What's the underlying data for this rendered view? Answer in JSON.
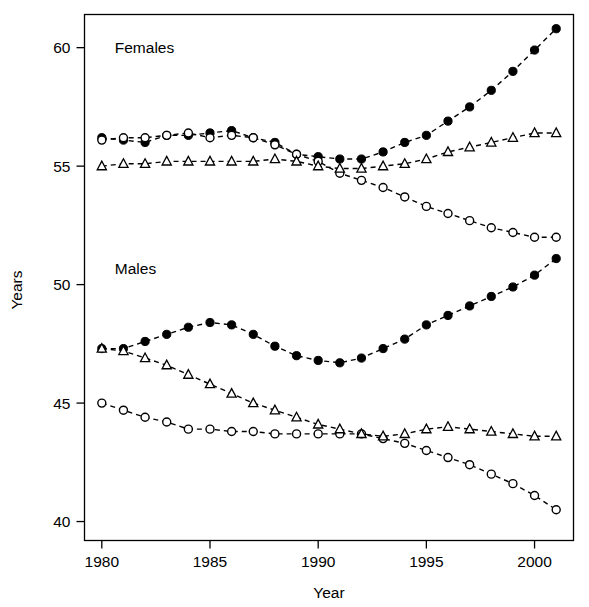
{
  "chart_data": {
    "type": "line",
    "title": "",
    "xlabel": "Year",
    "ylabel": "Years",
    "xlim": [
      1979.2,
      2001.8
    ],
    "ylim": [
      39.2,
      61.4
    ],
    "xticks": [
      1980,
      1985,
      1990,
      1995,
      2000
    ],
    "yticks": [
      40,
      45,
      50,
      55,
      60
    ],
    "grid": false,
    "legend": "none",
    "annotations": [
      {
        "text": "Females",
        "x": 1980.6,
        "y": 60.0
      },
      {
        "text": "Males",
        "x": 1980.6,
        "y": 50.7
      }
    ],
    "x": [
      1980,
      1981,
      1982,
      1983,
      1984,
      1985,
      1986,
      1987,
      1988,
      1989,
      1990,
      1991,
      1992,
      1993,
      1994,
      1995,
      1996,
      1997,
      1998,
      1999,
      2000,
      2001
    ],
    "series": [
      {
        "name": "Females - filled circle",
        "group": "Females",
        "marker": "filled-circle",
        "values": [
          56.2,
          56.1,
          56.0,
          56.3,
          56.3,
          56.4,
          56.5,
          56.2,
          56.0,
          55.5,
          55.4,
          55.3,
          55.3,
          55.6,
          56.0,
          56.3,
          56.9,
          57.5,
          58.2,
          59.0,
          59.9,
          60.8
        ]
      },
      {
        "name": "Females - open circle",
        "group": "Females",
        "marker": "open-circle",
        "values": [
          56.1,
          56.2,
          56.2,
          56.3,
          56.4,
          56.2,
          56.3,
          56.2,
          55.9,
          55.5,
          55.2,
          54.7,
          54.4,
          54.1,
          53.7,
          53.3,
          53.0,
          52.7,
          52.4,
          52.2,
          52.0,
          52.0
        ]
      },
      {
        "name": "Females - triangle",
        "group": "Females",
        "marker": "triangle",
        "values": [
          55.0,
          55.1,
          55.1,
          55.2,
          55.2,
          55.2,
          55.2,
          55.2,
          55.3,
          55.2,
          55.0,
          54.9,
          54.9,
          55.0,
          55.1,
          55.3,
          55.6,
          55.8,
          56.0,
          56.2,
          56.4,
          56.4
        ]
      },
      {
        "name": "Males - filled circle",
        "group": "Males",
        "marker": "filled-circle",
        "values": [
          47.3,
          47.3,
          47.6,
          47.9,
          48.2,
          48.4,
          48.3,
          47.9,
          47.4,
          47.0,
          46.8,
          46.7,
          46.9,
          47.3,
          47.7,
          48.3,
          48.7,
          49.1,
          49.5,
          49.9,
          50.4,
          51.1
        ]
      },
      {
        "name": "Males - open circle",
        "group": "Males",
        "marker": "open-circle",
        "values": [
          45.0,
          44.7,
          44.4,
          44.2,
          43.9,
          43.9,
          43.8,
          43.8,
          43.7,
          43.7,
          43.7,
          43.7,
          43.7,
          43.5,
          43.3,
          43.0,
          42.7,
          42.4,
          42.0,
          41.6,
          41.1,
          40.5
        ]
      },
      {
        "name": "Males - triangle",
        "group": "Males",
        "marker": "triangle",
        "values": [
          47.3,
          47.2,
          46.9,
          46.6,
          46.2,
          45.8,
          45.4,
          45.0,
          44.7,
          44.4,
          44.1,
          43.9,
          43.7,
          43.6,
          43.7,
          43.9,
          44.0,
          43.9,
          43.8,
          43.7,
          43.6,
          43.6
        ]
      }
    ]
  },
  "axes": {
    "x_title": "Year",
    "y_title": "Years",
    "x_tick_labels": [
      "1980",
      "1985",
      "1990",
      "1995",
      "2000"
    ],
    "y_tick_labels": [
      "40",
      "45",
      "50",
      "55",
      "60"
    ]
  },
  "labels": {
    "females": "Females",
    "males": "Males"
  }
}
